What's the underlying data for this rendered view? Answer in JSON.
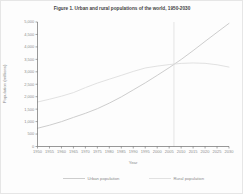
{
  "figure": {
    "background": "#fdfdfd",
    "border_color": "#e6e6e6"
  },
  "chart_data": {
    "type": "line",
    "title": "Figure 1. Urban and rural populations of the world, 1950-2030",
    "xlabel": "Year",
    "ylabel": "Population (millions)",
    "x": [
      1950,
      1955,
      1960,
      1965,
      1970,
      1975,
      1980,
      1985,
      1990,
      1995,
      2000,
      2005,
      2010,
      2015,
      2020,
      2025,
      2030
    ],
    "xlim": [
      1950,
      2030
    ],
    "ylim": [
      0,
      5000
    ],
    "ytick_step": 500,
    "grid": false,
    "legend_position": "bottom",
    "title_color": "#3f3f3f",
    "axis_color": "#6b6b6b",
    "tick_label_color": "#8c8c8c",
    "marker_line": {
      "year": 2007,
      "color": "#dadada"
    },
    "series": [
      {
        "name": "Urban population",
        "color": "#c7c7c7",
        "values": [
          733,
          855,
          998,
          1168,
          1332,
          1518,
          1742,
          1992,
          2273,
          2555,
          2857,
          3166,
          3494,
          3850,
          4221,
          4585,
          4945
        ]
      },
      {
        "name": "Rural population",
        "color": "#dedede",
        "values": [
          1786,
          1898,
          2020,
          2164,
          2364,
          2547,
          2703,
          2857,
          3015,
          3153,
          3229,
          3290,
          3338,
          3355,
          3340,
          3282,
          3190
        ]
      }
    ]
  }
}
